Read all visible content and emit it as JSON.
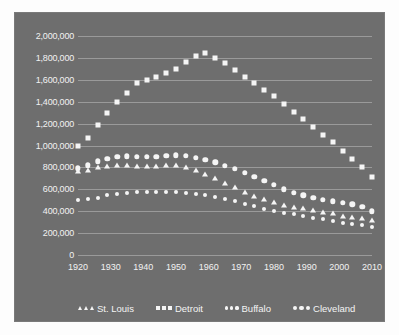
{
  "chart_data": {
    "type": "line",
    "title": "",
    "xlabel": "",
    "ylabel": "",
    "grid": true,
    "legend_position": "bottom",
    "xlim": [
      1920,
      2010
    ],
    "ylim": [
      0,
      2000000
    ],
    "y_ticks": [
      "0",
      "200,000",
      "400,000",
      "600,000",
      "800,000",
      "1,000,000",
      "1,200,000",
      "1,400,000",
      "1,600,000",
      "1,800,000",
      "2,000,000"
    ],
    "y_tick_values": [
      0,
      200000,
      400000,
      600000,
      800000,
      1000000,
      1200000,
      1400000,
      1600000,
      1800000,
      2000000
    ],
    "x_ticks": [
      "1920",
      "1930",
      "1940",
      "1950",
      "1960",
      "1970",
      "1980",
      "1990",
      "2000",
      "2010"
    ],
    "x_tick_values": [
      1920,
      1930,
      1940,
      1950,
      1960,
      1970,
      1980,
      1990,
      2000,
      2010
    ],
    "x": [
      1920,
      1923,
      1926,
      1929,
      1932,
      1935,
      1938,
      1941,
      1944,
      1947,
      1950,
      1953,
      1956,
      1959,
      1962,
      1965,
      1968,
      1971,
      1974,
      1977,
      1980,
      1983,
      1986,
      1989,
      1992,
      1995,
      1998,
      2001,
      2004,
      2007,
      2010
    ],
    "series": [
      {
        "name": "St. Louis",
        "marker": "triangle",
        "values": [
          770000,
          780000,
          800000,
          815000,
          820000,
          818000,
          812000,
          810000,
          815000,
          820000,
          825000,
          805000,
          775000,
          740000,
          700000,
          660000,
          620000,
          575000,
          540000,
          510000,
          480000,
          460000,
          440000,
          425000,
          410000,
          395000,
          380000,
          360000,
          348000,
          335000,
          320000
        ]
      },
      {
        "name": "Detroit",
        "marker": "square",
        "values": [
          995000,
          1065000,
          1190000,
          1300000,
          1400000,
          1480000,
          1570000,
          1600000,
          1630000,
          1665000,
          1700000,
          1760000,
          1815000,
          1845000,
          1800000,
          1750000,
          1690000,
          1630000,
          1570000,
          1510000,
          1450000,
          1380000,
          1310000,
          1240000,
          1170000,
          1100000,
          1030000,
          950000,
          880000,
          800000,
          715000
        ]
      },
      {
        "name": "Buffalo",
        "marker": "dot",
        "values": [
          500000,
          510000,
          525000,
          545000,
          560000,
          570000,
          575000,
          578000,
          578000,
          575000,
          572000,
          565000,
          555000,
          545000,
          530000,
          515000,
          495000,
          470000,
          445000,
          420000,
          400000,
          385000,
          370000,
          355000,
          340000,
          325000,
          310000,
          295000,
          282000,
          270000,
          260000
        ]
      },
      {
        "name": "Cleveland",
        "marker": "circle",
        "values": [
          790000,
          820000,
          855000,
          880000,
          895000,
          900000,
          898000,
          895000,
          898000,
          905000,
          912000,
          905000,
          890000,
          870000,
          845000,
          815000,
          785000,
          750000,
          715000,
          680000,
          640000,
          600000,
          570000,
          545000,
          525000,
          505000,
          492000,
          478000,
          462000,
          440000,
          400000
        ]
      }
    ]
  }
}
